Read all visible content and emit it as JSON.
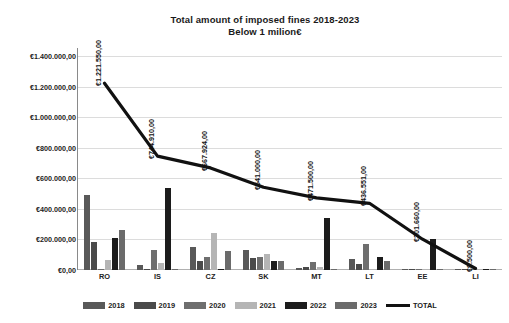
{
  "chart_data": {
    "type": "bar",
    "title": "Total amount of imposed fines 2018-2023",
    "subtitle": "Below 1 milion€",
    "xlabel": "",
    "ylabel": "",
    "ylim": [
      0,
      1400000
    ],
    "grid": true,
    "legend_position": "bottom",
    "ytick_labels": [
      "€1.400.000,00",
      "€1.200.000,00",
      "€1.000.000,00",
      "€800.000,00",
      "€600.000,00",
      "€400.000,00",
      "€200.000,00",
      "€0,00"
    ],
    "ytick_values": [
      1400000,
      1200000,
      1000000,
      800000,
      600000,
      400000,
      200000,
      0
    ],
    "categories": [
      "RO",
      "IS",
      "CZ",
      "SK",
      "MT",
      "LT",
      "EE",
      "LI"
    ],
    "series": [
      {
        "name": "2018",
        "color": "#595959",
        "values": [
          490000,
          30000,
          150000,
          130000,
          15000,
          70000,
          3000,
          0
        ]
      },
      {
        "name": "2019",
        "color": "#4a4a4a",
        "values": [
          185000,
          0,
          58000,
          78000,
          18000,
          42000,
          0,
          0
        ]
      },
      {
        "name": "2020",
        "color": "#6e6e6e",
        "values": [
          0,
          133000,
          85000,
          82000,
          55000,
          172000,
          2000,
          0
        ]
      },
      {
        "name": "2021",
        "color": "#b5b5b5",
        "values": [
          65000,
          45000,
          240000,
          108000,
          22000,
          0,
          0,
          0
        ]
      },
      {
        "name": "2022",
        "color": "#1c1c1c",
        "values": [
          210000,
          538000,
          8000,
          62000,
          342000,
          85000,
          200000,
          0
        ]
      },
      {
        "name": "2023",
        "color": "#6b6b6b",
        "values": [
          265000,
          0,
          122000,
          62000,
          4000,
          62000,
          2000,
          3000
        ]
      }
    ],
    "line_series": {
      "name": "TOTAL",
      "color": "#111111",
      "values": [
        1221550,
        744910,
        667924,
        541000,
        471500,
        436551,
        201660,
        9500
      ],
      "labels": [
        "€1.221.550,00",
        "€744.910,00",
        "€667.924,00",
        "€541.000,00",
        "€471.500,00",
        "€436.551,00",
        "€201.660,00",
        "€9.500,00"
      ]
    },
    "legend": [
      {
        "label": "2018",
        "color": "#595959",
        "marker": "box"
      },
      {
        "label": "2019",
        "color": "#4a4a4a",
        "marker": "box"
      },
      {
        "label": "2020",
        "color": "#6e6e6e",
        "marker": "box"
      },
      {
        "label": "2021",
        "color": "#b5b5b5",
        "marker": "box"
      },
      {
        "label": "2022",
        "color": "#1c1c1c",
        "marker": "box"
      },
      {
        "label": "2023",
        "color": "#6b6b6b",
        "marker": "box"
      },
      {
        "label": "TOTAL",
        "color": "#111111",
        "marker": "line"
      }
    ]
  }
}
